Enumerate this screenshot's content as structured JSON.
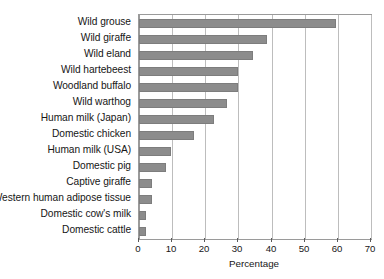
{
  "chart_data": {
    "type": "bar",
    "orientation": "horizontal",
    "title": "",
    "subtitle": "",
    "xlabel": "Percentage",
    "ylabel": "",
    "xlim": [
      0,
      70
    ],
    "xticks": [
      0,
      10,
      20,
      30,
      40,
      50,
      60,
      70
    ],
    "xtick_labels": [
      "0",
      "10",
      "20",
      "30",
      "40",
      "50",
      "60",
      "70"
    ],
    "grid": "vertical",
    "legend": "none",
    "legend_entries": [],
    "annotations": [],
    "bar_color": "#8c8c8c",
    "gridline_color": "#bdbdbd",
    "axis_color": "#9a9a9a",
    "categories": [
      "Wild grouse",
      "Wild giraffe",
      "Wild eland",
      "Wild hartebeest",
      "Woodland buffalo",
      "Wild warthog",
      "Human milk (Japan)",
      "Domestic chicken",
      "Human milk (USA)",
      "Domestic pig",
      "Captive giraffe",
      "Western human adipose tissue",
      "Domestic cow's milk",
      "Domestic cattle"
    ],
    "values": [
      59.5,
      38.5,
      34.5,
      30.0,
      30.0,
      26.7,
      22.7,
      16.5,
      9.7,
      8.0,
      4.0,
      4.0,
      2.0,
      2.0
    ]
  }
}
